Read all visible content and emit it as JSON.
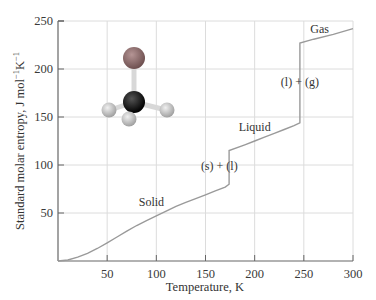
{
  "chart_data": {
    "type": "line",
    "title": "",
    "xlabel": "Temperature, K",
    "ylabel": "Standard molar entropy, J mol⁻¹K⁻¹",
    "ylabel_parts": {
      "main": "Standard molar entropy, J mol",
      "sup1": "−1",
      "k": "K",
      "sup2": "−1"
    },
    "xlim": [
      0,
      300
    ],
    "ylim": [
      0,
      250
    ],
    "xticks": [
      50,
      100,
      150,
      200,
      250,
      300
    ],
    "yticks": [
      50,
      100,
      150,
      200,
      250
    ],
    "grid": true,
    "legend": null,
    "series": [
      {
        "name": "Standard molar entropy",
        "color": "#9a9a9a",
        "x": [
          0,
          10,
          20,
          30,
          40,
          50,
          60,
          70,
          80,
          90,
          100,
          110,
          120,
          130,
          140,
          150,
          160,
          170,
          174,
          174,
          190,
          200,
          210,
          220,
          230,
          240,
          246,
          246,
          260,
          280,
          300
        ],
        "y": [
          0,
          1,
          4,
          8,
          13,
          19,
          25,
          31,
          37,
          42,
          47,
          52,
          57,
          61,
          65,
          69,
          73,
          77,
          80,
          115,
          121,
          125,
          129,
          133,
          137,
          141,
          144,
          227,
          231,
          236,
          242
        ]
      }
    ],
    "annotations": [
      {
        "text": "Solid",
        "x": 95,
        "y": 57
      },
      {
        "text": "(s) + (l)",
        "x": 164,
        "y": 95
      },
      {
        "text": "Liquid",
        "x": 200,
        "y": 135
      },
      {
        "text": "(l) + (g)",
        "x": 246,
        "y": 182
      },
      {
        "text": "Gas",
        "x": 266,
        "y": 237
      }
    ],
    "transitions": [
      {
        "name": "melting",
        "T": 174,
        "from": 80,
        "to": 115
      },
      {
        "name": "boiling",
        "T": 246,
        "from": 144,
        "to": 227
      }
    ],
    "inset": {
      "description": "ball-and-stick molecule model (one large gray-red atom bonded to central black atom with three light gray atoms)"
    }
  },
  "colors": {
    "axis": "#666666",
    "grid": "#dcdcdc",
    "curve": "#9a9a9a",
    "central_atom": "#1a1a1a",
    "top_atom": "#8a6a6a",
    "small_atoms": "#c8c8c8"
  }
}
